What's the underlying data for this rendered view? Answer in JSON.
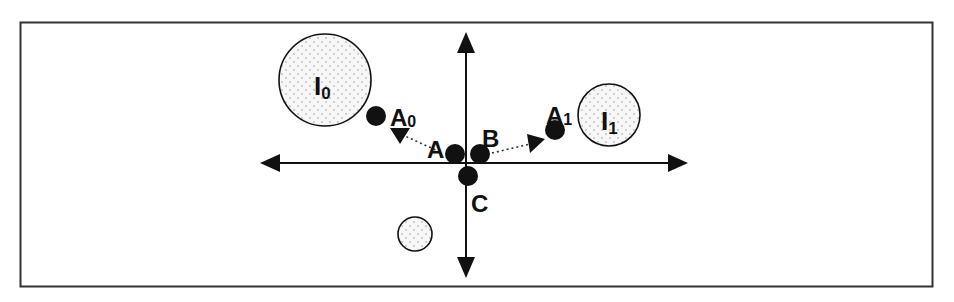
{
  "colors": {
    "stroke": "#111111",
    "border": "#333333",
    "fill_dot": "#111111",
    "circle_fill": "#f7f7f7",
    "stipple": "#8a8a8a",
    "background": "#ffffff"
  },
  "labels": {
    "A": "A",
    "B": "B",
    "C": "C",
    "A0_main": "A",
    "A0_sub": "0",
    "A1_main": "A",
    "A1_sub": "1",
    "I0_main": "I",
    "I0_sub": "0",
    "I1_main": "I",
    "I1_sub": "1"
  },
  "axes": {
    "origin": [
      466,
      163
    ],
    "x_range": [
      260,
      688
    ],
    "y_range": [
      32,
      278
    ]
  },
  "points": [
    {
      "id": "A",
      "x": 455,
      "y": 154,
      "r": 10
    },
    {
      "id": "B",
      "x": 480,
      "y": 154,
      "r": 10
    },
    {
      "id": "C",
      "x": 468,
      "y": 176,
      "r": 10
    },
    {
      "id": "A0",
      "x": 376,
      "y": 116,
      "r": 10
    },
    {
      "id": "A1",
      "x": 555,
      "y": 130,
      "r": 10
    }
  ],
  "regions": [
    {
      "id": "I0",
      "x": 325,
      "y": 80,
      "r": 46
    },
    {
      "id": "I1",
      "x": 609,
      "y": 115,
      "r": 31
    },
    {
      "id": "unlabeled",
      "x": 415,
      "y": 234,
      "r": 17
    }
  ],
  "dotted_arrows": [
    {
      "from": "A",
      "to_direction": "A0"
    },
    {
      "from": "B",
      "to_direction": "A1"
    }
  ]
}
